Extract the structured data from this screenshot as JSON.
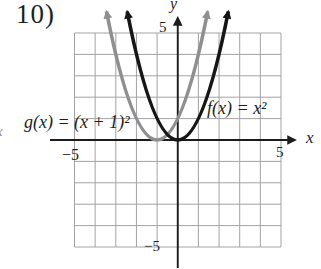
{
  "problem_number": "10)",
  "clipped_edge_text": "x",
  "chart_data": {
    "type": "line",
    "title": "",
    "xlabel": "x",
    "ylabel": "y",
    "xlim": [
      -5,
      5
    ],
    "ylim": [
      -5,
      5
    ],
    "grid": true,
    "x_ticks": [
      {
        "value": -5,
        "label": "−5"
      },
      {
        "value": 5,
        "label": "5"
      }
    ],
    "y_ticks": [
      {
        "value": -5,
        "label": "−5"
      },
      {
        "value": 5,
        "label": "5"
      }
    ],
    "series": [
      {
        "name": "f",
        "label": "f(x) = x²",
        "equation": "f(x) = x^2",
        "vertex": [
          0,
          0
        ],
        "coefficient": 1,
        "color": "#161616",
        "points_x": [
          -2,
          -1,
          0,
          1,
          2
        ],
        "points_y": [
          4,
          1,
          0,
          1,
          4
        ]
      },
      {
        "name": "g",
        "label": "g(x) = (x + 1)²",
        "equation": "g(x) = (x+1)^2",
        "vertex": [
          -1,
          0
        ],
        "coefficient": 1,
        "color": "#8f8f8f",
        "points_x": [
          -3,
          -2,
          -1,
          0,
          1
        ],
        "points_y": [
          4,
          1,
          0,
          1,
          4
        ]
      }
    ]
  }
}
